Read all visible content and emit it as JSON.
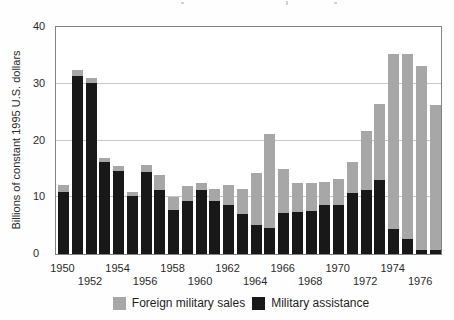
{
  "chart_data": {
    "type": "bar",
    "stacked": true,
    "title": "",
    "xlabel": "",
    "ylabel": "Billions of constant 1995 U.S. dollars",
    "ylim": [
      0,
      40
    ],
    "yticks": [
      0,
      10,
      20,
      30,
      40
    ],
    "gridline_values": [
      10,
      20,
      30
    ],
    "grid": "horizontal",
    "legend_position": "bottom",
    "categories": [
      "1950",
      "1951",
      "1952",
      "1953",
      "1954",
      "1955",
      "1956",
      "1957",
      "1958",
      "1959",
      "1960",
      "1961",
      "1962",
      "1963",
      "1964",
      "1965",
      "1966",
      "1967",
      "1968",
      "1969",
      "1970",
      "1971",
      "1972",
      "1973",
      "1974",
      "1975",
      "1976",
      "1977"
    ],
    "x_tick_rows": {
      "row1": [
        "1950",
        "1954",
        "1958",
        "1962",
        "1966",
        "1970",
        "1974"
      ],
      "row2": [
        "1952",
        "1956",
        "1960",
        "1964",
        "1968",
        "1972",
        "1976"
      ]
    },
    "series": [
      {
        "name": "Military assistance",
        "color": "#181818",
        "stack_position": "bottom",
        "values": [
          11.0,
          31.4,
          30.2,
          16.2,
          14.7,
          10.3,
          14.4,
          11.3,
          7.8,
          9.4,
          11.2,
          9.3,
          8.7,
          7.0,
          5.2,
          4.5,
          7.2,
          7.4,
          7.5,
          8.7,
          8.7,
          10.7,
          11.3,
          13.0,
          4.4,
          2.6,
          0.7,
          0.7
        ]
      },
      {
        "name": "Foreign military sales",
        "color": "#a7a7a7",
        "stack_position": "top",
        "values": [
          1.2,
          1.0,
          0.8,
          0.7,
          0.8,
          0.6,
          1.3,
          2.6,
          2.3,
          2.6,
          1.3,
          2.1,
          3.5,
          4.4,
          9.0,
          16.6,
          7.7,
          5.1,
          5.0,
          4.0,
          4.6,
          5.6,
          10.4,
          13.5,
          30.9,
          32.7,
          32.5,
          25.6
        ]
      }
    ],
    "legend": [
      {
        "label": "Foreign military sales",
        "color": "#a7a7a7"
      },
      {
        "label": "Military assistance",
        "color": "#181818"
      }
    ]
  }
}
